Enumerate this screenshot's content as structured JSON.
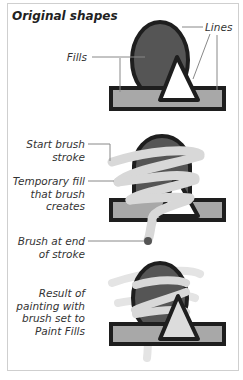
{
  "title": "Original shapes",
  "labels": {
    "fills": "Fills",
    "lines": "Lines",
    "start_brush_1": "Start brush",
    "start_brush_2": "stroke",
    "temp_fill_1": "Temporary fill",
    "temp_fill_2": "that brush",
    "temp_fill_3": "creates",
    "brush_end_1": "Brush at end",
    "brush_end_2": "of stroke",
    "result_1": "Result of",
    "result_2": "painting with",
    "result_3": "brush set to",
    "result_4": "Paint Fills"
  },
  "colors": {
    "outline": "#1e1e1e",
    "ellipse_fill": "#555555",
    "rect_fill": "#a8a8a8",
    "triangle_fill": "#ffffff",
    "brush": "#d8d8d8"
  }
}
